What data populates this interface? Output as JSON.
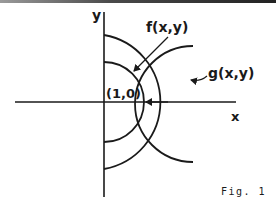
{
  "figure": {
    "caption": "Fig. 1",
    "axes": {
      "x_label": "x",
      "y_label": "y"
    },
    "labels": {
      "f": "f(x,y)",
      "g": "g(x,y)",
      "point": "(1,0)"
    },
    "colors": {
      "ink": "#1a1a1a",
      "background": "#ffffff"
    }
  }
}
